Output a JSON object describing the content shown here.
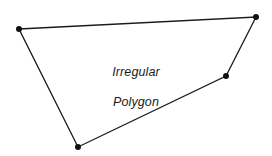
{
  "figure": {
    "name": "irregular-polygon",
    "caption_line_1": "Irregular",
    "caption_line_2": "Polygon",
    "background_color": "#ffffff",
    "stroke_color": "#1a1a1a",
    "vertex_color": "#111111",
    "fill_color": "#ffffff",
    "stroke_width": "1.3",
    "vertex_radius": "3",
    "canvas": {
      "width": 272,
      "height": 156
    }
  },
  "chart_data": {
    "type": "scatter",
    "title": "Irregular Polygon",
    "xlabel": "",
    "ylabel": "",
    "grid": false,
    "legend": "none",
    "xlim": [
      0,
      272
    ],
    "ylim": [
      0,
      156
    ],
    "shape": "closed-polygon",
    "vertex_count": 4,
    "vertices": [
      {
        "label": "top-left",
        "x": 19,
        "y": 29
      },
      {
        "label": "top-right",
        "x": 256,
        "y": 17
      },
      {
        "label": "mid-right",
        "x": 226,
        "y": 76
      },
      {
        "label": "bottom",
        "x": 78,
        "y": 147
      }
    ],
    "edges": [
      {
        "from": "top-left",
        "to": "top-right"
      },
      {
        "from": "top-right",
        "to": "mid-right"
      },
      {
        "from": "mid-right",
        "to": "bottom"
      },
      {
        "from": "bottom",
        "to": "top-left"
      }
    ],
    "points_path": "19,29 256,17 226,76 78,147"
  }
}
